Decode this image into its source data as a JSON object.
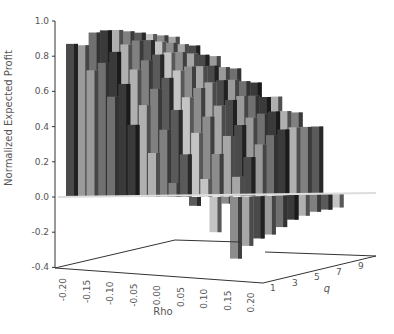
{
  "chart_data": {
    "type": "bar3d",
    "title": "",
    "xlabel": "Rho",
    "ylabel": "q",
    "zlabel": "Normalized Expected Profit",
    "rho_values": [
      "-0.20",
      "-0.15",
      "-0.10",
      "-0.05",
      "0.00",
      "0.05",
      "0.10",
      "0.15",
      "0.20"
    ],
    "q_values": [
      1,
      2,
      3,
      4,
      5,
      6,
      7,
      8,
      9,
      10
    ],
    "q_tick_labels": [
      "1",
      "3",
      "5",
      "7",
      "9"
    ],
    "z_ticks": [
      "1.0",
      "0.8",
      "0.6",
      "0.4",
      "0.2",
      "0.0",
      "-0.2",
      "-0.4"
    ],
    "zlim": [
      -0.4,
      1.0
    ],
    "grid": false,
    "legend": null,
    "values": [
      [
        0.87,
        0.86,
        0.93,
        0.94,
        0.94,
        0.93,
        0.92,
        0.91,
        0.9,
        0.89
      ],
      [
        0.72,
        0.76,
        0.82,
        0.86,
        0.88,
        0.88,
        0.87,
        0.86,
        0.85,
        0.84
      ],
      [
        0.57,
        0.64,
        0.72,
        0.77,
        0.8,
        0.81,
        0.81,
        0.8,
        0.79,
        0.78
      ],
      [
        0.41,
        0.52,
        0.61,
        0.67,
        0.71,
        0.73,
        0.73,
        0.73,
        0.72,
        0.71
      ],
      [
        0.25,
        0.38,
        0.49,
        0.56,
        0.61,
        0.64,
        0.65,
        0.65,
        0.64,
        0.63
      ],
      [
        0.08,
        0.24,
        0.36,
        0.45,
        0.51,
        0.54,
        0.56,
        0.56,
        0.55,
        0.55
      ],
      [
        -0.05,
        0.1,
        0.24,
        0.34,
        0.4,
        0.44,
        0.46,
        0.47,
        0.47,
        0.46
      ],
      [
        -0.2,
        -0.04,
        0.11,
        0.22,
        0.29,
        0.34,
        0.37,
        0.38,
        0.38,
        0.38
      ],
      [
        -0.35,
        -0.28,
        -0.24,
        -0.22,
        -0.18,
        -0.14,
        -0.12,
        -0.1,
        -0.09,
        -0.08
      ]
    ],
    "colors": [
      "#4a4a4a",
      "#9a9a9a",
      "#707070",
      "#3a3a3a",
      "#b0b0b0",
      "#808080",
      "#5a5a5a",
      "#c4c4c4",
      "#8c8c8c",
      "#a6a6a6"
    ]
  }
}
